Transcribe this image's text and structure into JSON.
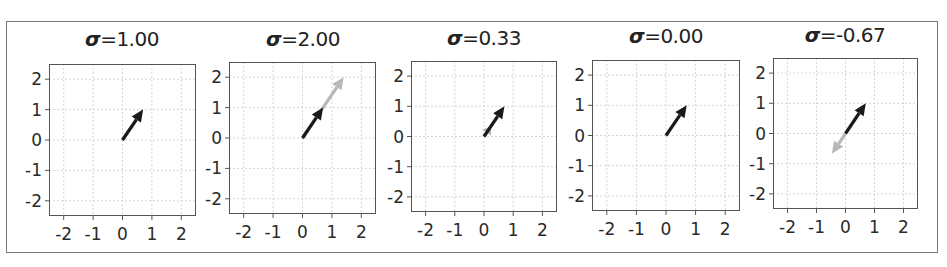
{
  "figure": {
    "panel_count": 5,
    "title_symbol": "σ"
  },
  "chart_data": [
    {
      "type": "quiver",
      "title": "σ=1.00",
      "sigma_label": "=1.00",
      "sigma": 1.0,
      "xlim": [
        -2.5,
        2.5
      ],
      "ylim": [
        -2.5,
        2.5
      ],
      "xticks": [
        "-2",
        "-1",
        "0",
        "1",
        "2"
      ],
      "yticks": [
        "2",
        "1",
        "0",
        "-1",
        "-2"
      ],
      "grid": true,
      "vectors": [
        {
          "name": "base",
          "color": "#1a1a1a",
          "x0": 0,
          "y0": 0,
          "dx": 0.7,
          "dy": 1.0
        },
        {
          "name": "scaled",
          "color": "#b8b8b8",
          "x0": 0,
          "y0": 0,
          "dx": 0.7,
          "dy": 1.0
        }
      ]
    },
    {
      "type": "quiver",
      "title": "σ=2.00",
      "sigma_label": "=2.00",
      "sigma": 2.0,
      "xlim": [
        -2.5,
        2.5
      ],
      "ylim": [
        -2.5,
        2.5
      ],
      "xticks": [
        "-2",
        "-1",
        "0",
        "1",
        "2"
      ],
      "yticks": [
        "2",
        "1",
        "0",
        "-1",
        "-2"
      ],
      "grid": true,
      "vectors": [
        {
          "name": "base",
          "color": "#1a1a1a",
          "x0": 0,
          "y0": 0,
          "dx": 0.7,
          "dy": 1.0
        },
        {
          "name": "scaled",
          "color": "#b8b8b8",
          "x0": 0,
          "y0": 0,
          "dx": 1.4,
          "dy": 2.0
        }
      ]
    },
    {
      "type": "quiver",
      "title": "σ=0.33",
      "sigma_label": "=0.33",
      "sigma": 0.33,
      "xlim": [
        -2.5,
        2.5
      ],
      "ylim": [
        -2.5,
        2.5
      ],
      "xticks": [
        "-2",
        "-1",
        "0",
        "1",
        "2"
      ],
      "yticks": [
        "2",
        "1",
        "0",
        "-1",
        "-2"
      ],
      "grid": true,
      "vectors": [
        {
          "name": "base",
          "color": "#1a1a1a",
          "x0": 0,
          "y0": 0,
          "dx": 0.7,
          "dy": 1.0
        },
        {
          "name": "scaled",
          "color": "#b8b8b8",
          "x0": 0,
          "y0": 0,
          "dx": 0.23,
          "dy": 0.33
        }
      ]
    },
    {
      "type": "quiver",
      "title": "σ=0.00",
      "sigma_label": "=0.00",
      "sigma": 0.0,
      "xlim": [
        -2.5,
        2.5
      ],
      "ylim": [
        -2.5,
        2.5
      ],
      "xticks": [
        "-2",
        "-1",
        "0",
        "1",
        "2"
      ],
      "yticks": [
        "2",
        "1",
        "0",
        "-1",
        "-2"
      ],
      "grid": true,
      "vectors": [
        {
          "name": "base",
          "color": "#1a1a1a",
          "x0": 0,
          "y0": 0,
          "dx": 0.7,
          "dy": 1.0
        },
        {
          "name": "scaled",
          "color": "#b8b8b8",
          "x0": 0,
          "y0": 0,
          "dx": 0.0,
          "dy": 0.0
        }
      ]
    },
    {
      "type": "quiver",
      "title": "σ=-0.67",
      "sigma_label": "=-0.67",
      "sigma": -0.67,
      "xlim": [
        -2.5,
        2.5
      ],
      "ylim": [
        -2.5,
        2.5
      ],
      "xticks": [
        "-2",
        "-1",
        "0",
        "1",
        "2"
      ],
      "yticks": [
        "2",
        "1",
        "0",
        "-1",
        "-2"
      ],
      "grid": true,
      "vectors": [
        {
          "name": "base",
          "color": "#1a1a1a",
          "x0": 0,
          "y0": 0,
          "dx": 0.7,
          "dy": 1.0
        },
        {
          "name": "scaled",
          "color": "#b8b8b8",
          "x0": 0,
          "y0": 0,
          "dx": -0.47,
          "dy": -0.67
        }
      ]
    }
  ],
  "layout": {
    "panels": [
      {
        "box_x": 49,
        "box_y": 64,
        "box_w": 147,
        "box_h": 152,
        "title_cx": 122,
        "title_y": 27
      },
      {
        "box_x": 229,
        "box_y": 62,
        "box_w": 147,
        "box_h": 152,
        "title_cx": 303,
        "title_y": 27
      },
      {
        "box_x": 411,
        "box_y": 61,
        "box_w": 146,
        "box_h": 151,
        "title_cx": 484,
        "title_y": 26
      },
      {
        "box_x": 592,
        "box_y": 60,
        "box_w": 148,
        "box_h": 151,
        "title_cx": 666,
        "title_y": 24
      },
      {
        "box_x": 773,
        "box_y": 58,
        "box_w": 145,
        "box_h": 151,
        "title_cx": 845,
        "title_y": 23
      }
    ]
  }
}
